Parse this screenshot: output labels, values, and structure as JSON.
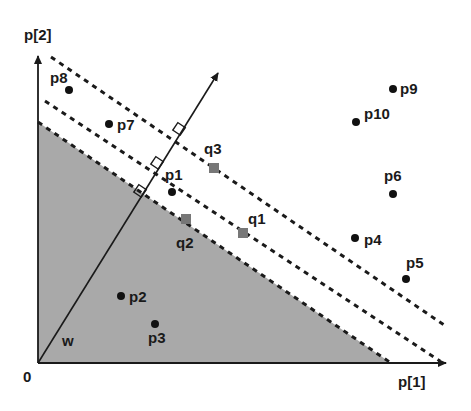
{
  "diagram": {
    "axes": {
      "x_label": "p[1]",
      "y_label": "p[2]",
      "origin_label": "0"
    },
    "vector": {
      "label": "w"
    },
    "colors": {
      "shaded_region": "#a9a9a9",
      "point": "#111111",
      "query_point": "#777777",
      "line": "#1a1a1a"
    },
    "points": [
      {
        "label": "p1",
        "x": 172,
        "y": 192
      },
      {
        "label": "p2",
        "x": 121,
        "y": 296
      },
      {
        "label": "p3",
        "x": 155,
        "y": 323
      },
      {
        "label": "p4",
        "x": 355,
        "y": 238
      },
      {
        "label": "p5",
        "x": 406,
        "y": 279
      },
      {
        "label": "p6",
        "x": 393,
        "y": 194
      },
      {
        "label": "p7",
        "x": 109,
        "y": 124
      },
      {
        "label": "p8",
        "x": 69,
        "y": 90
      },
      {
        "label": "p9",
        "x": 393,
        "y": 89
      },
      {
        "label": "p10",
        "x": 356,
        "y": 122
      }
    ],
    "queries": [
      {
        "label": "q1",
        "x": 243,
        "y": 233
      },
      {
        "label": "q2",
        "x": 186,
        "y": 219
      },
      {
        "label": "q3",
        "x": 214,
        "y": 168
      }
    ]
  }
}
